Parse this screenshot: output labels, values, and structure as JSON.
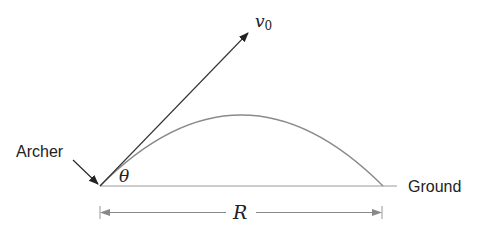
{
  "diagram": {
    "labels": {
      "archer": "Archer",
      "ground": "Ground",
      "velocity": "v",
      "velocity_subscript": "0",
      "angle": "θ",
      "range": "R"
    },
    "colors": {
      "vector": "#333333",
      "trajectory": "#8a8a8a",
      "ground": "#9a9a9a",
      "dimension": "#8a8a8a",
      "text": "#222222"
    },
    "geometry": {
      "origin": [
        100,
        186
      ],
      "velocity_tip": [
        248,
        33
      ],
      "apex": [
        243,
        115
      ],
      "landing": [
        383,
        186
      ],
      "ground_end": [
        397,
        186
      ],
      "range_line_y": 212
    }
  }
}
